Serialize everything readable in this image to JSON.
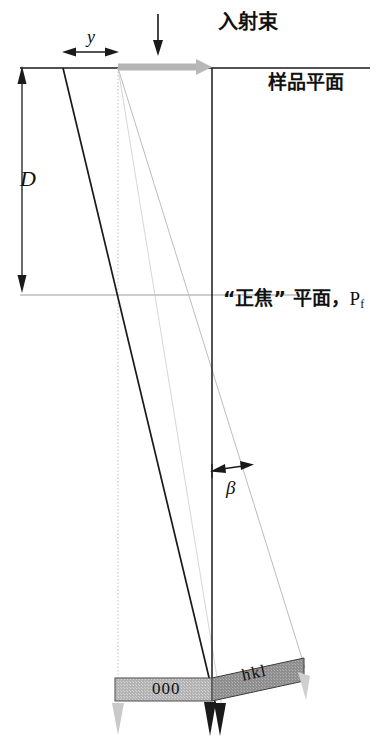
{
  "figure": {
    "type": "diagram",
    "labels": {
      "incident_beam": "入射束",
      "sample_plane": "样品平面",
      "focus_plane_quote": "“正焦” 平面，",
      "focus_plane_symbol": "P",
      "focus_plane_subscript": "f",
      "distance_D": "D",
      "offset_y": "y",
      "angle_beta": "β",
      "bar_direct": "000",
      "bar_diffracted": "hkl"
    },
    "colors": {
      "line": "#1a1a1a",
      "faint_line": "#b9b9b9",
      "beam_arrow_gray": "#b5b5b5",
      "bar_light_gray": "#b3b3b3",
      "bar_dark_gray": "#8e8e8e",
      "background": "#ffffff"
    },
    "geometry": {
      "sample_plane_y": 68,
      "sample_plane_x_range": [
        20,
        370
      ],
      "focus_plane_y": 295,
      "focus_plane_x_range": [
        20,
        300
      ],
      "vertical_axis_x": 212,
      "beam_entry_x": 118,
      "beam_arrow_x_range": [
        118,
        212
      ],
      "distance_D_y_range": [
        68,
        290
      ],
      "offset_y_x_range": [
        63,
        118
      ],
      "bar_000_x_range": [
        115,
        212
      ],
      "bar_000_y_range": [
        678,
        701
      ],
      "bar_hkl_x_range": [
        212,
        305
      ],
      "bar_hkl_tilt_deg": -12,
      "convergence_y": 690
    }
  }
}
